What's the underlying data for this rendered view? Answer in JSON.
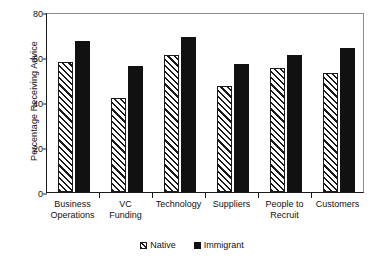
{
  "chart_data": {
    "type": "bar",
    "title": "",
    "xlabel": "",
    "ylabel": "Percentage Receiving Advice",
    "ylim": [
      0,
      80
    ],
    "yticks": [
      0,
      20,
      40,
      60,
      80
    ],
    "grid": false,
    "legend_position": "bottom",
    "categories": [
      "Business Operations",
      "VC Funding",
      "Technology",
      "Suppliers",
      "People to Recruit",
      "Customers"
    ],
    "category_lines": [
      [
        "Business",
        "Operations"
      ],
      [
        "VC",
        "Funding"
      ],
      [
        "Technology",
        ""
      ],
      [
        "Suppliers",
        ""
      ],
      [
        "People to",
        "Recruit"
      ],
      [
        "Customers",
        ""
      ]
    ],
    "series": [
      {
        "name": "Native",
        "fill": "diagonal-hatch",
        "color": "#1a1a1a",
        "values": [
          58,
          42,
          61,
          47,
          55,
          53
        ]
      },
      {
        "name": "Immigrant",
        "fill": "solid",
        "color": "#111111",
        "values": [
          67,
          56,
          69,
          57,
          61,
          64
        ]
      }
    ]
  },
  "legend": {
    "entries": [
      {
        "label": "Native"
      },
      {
        "label": "Immigrant"
      }
    ]
  }
}
